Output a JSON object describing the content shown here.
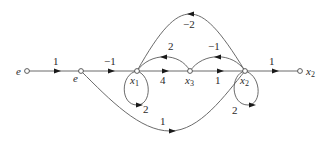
{
  "diagram": {
    "type": "signal-flow-graph",
    "nodes": [
      {
        "id": "e_in",
        "label": "e",
        "sub": ""
      },
      {
        "id": "e",
        "label": "e",
        "sub": ""
      },
      {
        "id": "x1",
        "label": "x",
        "sub": "1"
      },
      {
        "id": "x3",
        "label": "x",
        "sub": "3"
      },
      {
        "id": "x2",
        "label": "x",
        "sub": "2"
      },
      {
        "id": "x2_out",
        "label": "x",
        "sub": "2"
      }
    ],
    "branches": [
      {
        "from": "e_in",
        "to": "e",
        "gain": "1"
      },
      {
        "from": "e",
        "to": "x1",
        "gain": "−1"
      },
      {
        "from": "x1",
        "to": "x3",
        "gain": "4"
      },
      {
        "from": "x3",
        "to": "x2",
        "gain": "1"
      },
      {
        "from": "x2",
        "to": "x2_out",
        "gain": "1"
      },
      {
        "from": "x3",
        "to": "x1",
        "gain": "2"
      },
      {
        "from": "x2",
        "to": "x3",
        "gain": "−1"
      },
      {
        "from": "x2",
        "to": "x1",
        "gain": "−2"
      },
      {
        "from": "x1",
        "to": "x1",
        "gain": "2"
      },
      {
        "from": "x2",
        "to": "x2",
        "gain": "2"
      },
      {
        "from": "e",
        "to": "x2",
        "gain": "1"
      }
    ]
  }
}
